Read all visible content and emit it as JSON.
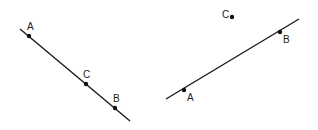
{
  "figures": [
    {
      "name": "collinear",
      "line": {
        "x1": 20,
        "y1": 29,
        "x2": 130,
        "y2": 121
      },
      "points": [
        {
          "label": "A",
          "x": 29,
          "y": 36,
          "lx": 27,
          "ly": 30
        },
        {
          "label": "C",
          "x": 86,
          "y": 84,
          "lx": 83,
          "ly": 78
        },
        {
          "label": "B",
          "x": 115,
          "y": 108,
          "lx": 113,
          "ly": 102
        }
      ]
    },
    {
      "name": "non-collinear",
      "line": {
        "x1": 166,
        "y1": 99,
        "x2": 299,
        "y2": 19
      },
      "points": [
        {
          "label": "A",
          "x": 184,
          "y": 90,
          "lx": 187,
          "ly": 101
        },
        {
          "label": "B",
          "x": 280,
          "y": 32,
          "lx": 283,
          "ly": 43
        },
        {
          "label": "C",
          "x": 232,
          "y": 17,
          "lx": 222,
          "ly": 18
        }
      ]
    }
  ],
  "colors": {
    "line": "#1a1a1a",
    "point": "#111111"
  }
}
